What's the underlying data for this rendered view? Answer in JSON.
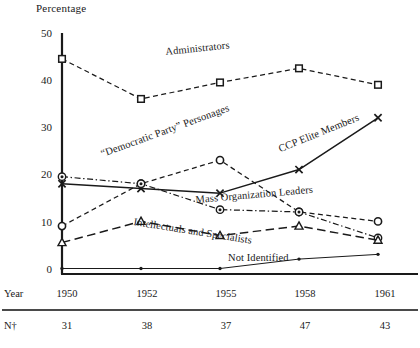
{
  "chart_data": {
    "type": "line",
    "title": "",
    "ylabel": "Percentage",
    "xlabel": "Year",
    "categories": [
      "1950",
      "1952",
      "1955",
      "1958",
      "1961"
    ],
    "ylim": [
      0,
      50
    ],
    "yticks": [
      "0",
      "10",
      "20",
      "30",
      "40",
      "50"
    ],
    "grid": false,
    "legend_position": "inline-annotations",
    "series": [
      {
        "name": "Administrators",
        "marker": "open-square",
        "line_style": "dashed",
        "values": [
          44.5,
          36,
          39.5,
          42.5,
          39
        ]
      },
      {
        "name": "“Democratic Party” Personages",
        "marker": "open-circle",
        "line_style": "dashed",
        "values": [
          9,
          18,
          23,
          12,
          10
        ]
      },
      {
        "name": "CCP Elite Members",
        "marker": "cross-x",
        "line_style": "solid",
        "values": [
          18,
          17,
          16,
          21,
          32
        ]
      },
      {
        "name": "Mass Organization Leaders",
        "marker": "circle-dot",
        "line_style": "dash-dot",
        "values": [
          19.5,
          18,
          12.5,
          12,
          6.5
        ]
      },
      {
        "name": "Intellectuals and Specialists",
        "marker": "open-triangle",
        "line_style": "long-dash",
        "values": [
          5.5,
          10,
          7,
          9,
          6
        ]
      },
      {
        "name": "Not Identified",
        "marker": "small-dot",
        "line_style": "thin-solid",
        "values": [
          0,
          0,
          0,
          2,
          3
        ]
      }
    ]
  },
  "table": {
    "year_row_label": "Year",
    "n_row_label": "N†",
    "years": [
      "1950",
      "1952",
      "1955",
      "1958",
      "1961"
    ],
    "n_values": [
      "31",
      "38",
      "37",
      "47",
      "43"
    ]
  },
  "colors": {
    "ink": "#1a1a1a",
    "background": "#ffffff"
  }
}
